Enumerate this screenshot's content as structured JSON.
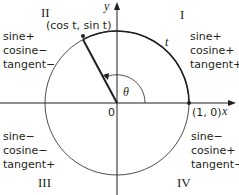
{
  "quadrants": [
    {
      "numeral": "II",
      "sine": "sine+",
      "cosine": "cosine−",
      "tangent": "tangent−"
    },
    {
      "numeral": "I",
      "sine": "sine+",
      "cosine": "cosine+",
      "tangent": "tangent+"
    },
    {
      "numeral": "III",
      "sine": "sine−",
      "cosine": "cosine−",
      "tangent": "tangent+"
    },
    {
      "numeral": "IV",
      "sine": "sine−",
      "cosine": "cosine+",
      "tangent": "tangent−"
    }
  ],
  "labels": {
    "point": "(cos t, sin t)",
    "arc": "t",
    "angle": "θ",
    "origin": "0",
    "unit_point": "(1, 0)",
    "x_axis": "x",
    "y_axis": "y"
  },
  "colors": {
    "line": "#231f20",
    "circle_light": "#555555"
  }
}
